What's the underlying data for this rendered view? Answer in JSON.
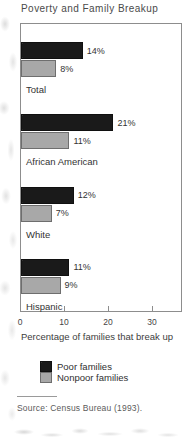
{
  "chart_data": {
    "type": "bar",
    "orientation": "horizontal",
    "title": "Poverty and Family Breakup",
    "xlabel": "Percentage of families that break up",
    "ylabel": "",
    "categories": [
      "Total",
      "African American",
      "White",
      "Hispanic"
    ],
    "series": [
      {
        "name": "Poor families",
        "color": "#1a1a1a",
        "values": [
          14,
          21,
          12,
          11
        ],
        "labels": [
          "14%",
          "21%",
          "12%",
          "11%"
        ]
      },
      {
        "name": "Nonpoor families",
        "color": "#a8a8a8",
        "values": [
          8,
          11,
          7,
          9
        ],
        "labels": [
          "8%",
          "11%",
          "7%",
          "9%"
        ]
      }
    ],
    "xlim": [
      0,
      36.8
    ],
    "xticks": [
      0,
      10,
      20,
      30
    ],
    "xtick_labels": [
      "0",
      "10",
      "20",
      "30"
    ],
    "grid": false,
    "legend_position": "bottom-center",
    "source": "Source: Census Bureau (1993)."
  },
  "legend": {
    "entries": [
      {
        "label": "Poor families",
        "swatch": "dark-square-swatch"
      },
      {
        "label": "Nonpoor families",
        "swatch": "gray-square-swatch"
      }
    ]
  },
  "colors": {
    "poor": "#1a1a1a",
    "nonpoor": "#a8a8a8",
    "frame": "#8d8d8d",
    "text": "#333333",
    "background": "#ffffff"
  }
}
